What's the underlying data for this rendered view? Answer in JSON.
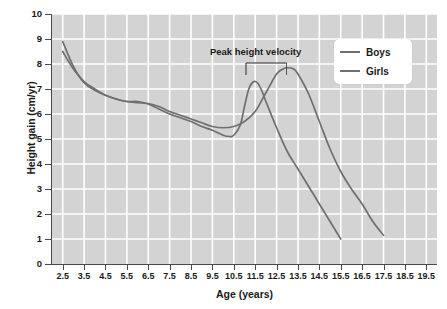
{
  "chart_data": {
    "type": "line",
    "title": "",
    "xlabel": "Age (years)",
    "ylabel": "Height gain (cm/yr)",
    "xlim": [
      2.0,
      20.0
    ],
    "ylim": [
      0,
      10
    ],
    "grid": true,
    "legend_position": "top-right",
    "x_ticks": [
      "2.5",
      "3.5",
      "4.5",
      "5.5",
      "6.5",
      "7.5",
      "8.5",
      "9.5",
      "10.5",
      "11.5",
      "12.5",
      "13.5",
      "14.5",
      "15.5",
      "16.5",
      "17.5",
      "18.5",
      "19.5"
    ],
    "y_ticks": [
      "0",
      "1",
      "2",
      "3",
      "4",
      "5",
      "6",
      "7",
      "8",
      "9",
      "10"
    ],
    "annotations": [
      {
        "text": "Peak height velocity",
        "bracket_from_x": 11.0,
        "bracket_to_x": 13.0,
        "bracket_y": 8.1
      }
    ],
    "series": [
      {
        "name": "Boys",
        "color": "#6f6f6f",
        "x": [
          2.5,
          3.0,
          3.5,
          4.0,
          4.5,
          5.0,
          5.5,
          6.0,
          6.5,
          7.0,
          7.5,
          8.0,
          8.5,
          9.0,
          9.5,
          10.0,
          10.5,
          11.0,
          11.5,
          12.0,
          12.5,
          12.8,
          13.0,
          13.3,
          13.5,
          14.0,
          14.5,
          15.0,
          15.5,
          16.0,
          16.5,
          17.0,
          17.5
        ],
        "y": [
          8.9,
          7.9,
          7.25,
          6.95,
          6.75,
          6.6,
          6.5,
          6.45,
          6.42,
          6.3,
          6.1,
          5.95,
          5.8,
          5.65,
          5.5,
          5.45,
          5.5,
          5.7,
          6.1,
          6.85,
          7.6,
          7.8,
          7.85,
          7.8,
          7.6,
          6.8,
          5.7,
          4.6,
          3.7,
          3.0,
          2.4,
          1.7,
          1.15
        ]
      },
      {
        "name": "Girls",
        "color": "#6f6f6f",
        "x": [
          2.5,
          3.0,
          3.5,
          4.0,
          4.5,
          5.0,
          5.5,
          6.0,
          6.5,
          7.0,
          7.5,
          8.0,
          8.5,
          9.0,
          9.5,
          10.0,
          10.3,
          10.5,
          10.8,
          11.0,
          11.2,
          11.4,
          11.6,
          11.8,
          12.0,
          12.5,
          13.0,
          13.5,
          14.0,
          14.5,
          15.0,
          15.5
        ],
        "y": [
          8.5,
          7.8,
          7.3,
          7.0,
          6.75,
          6.6,
          6.5,
          6.5,
          6.4,
          6.2,
          6.0,
          5.85,
          5.7,
          5.5,
          5.35,
          5.15,
          5.1,
          5.15,
          5.55,
          6.3,
          7.0,
          7.28,
          7.25,
          6.95,
          6.5,
          5.45,
          4.5,
          3.8,
          3.1,
          2.4,
          1.7,
          1.0
        ]
      }
    ]
  },
  "legend": {
    "items": [
      {
        "label": "Boys"
      },
      {
        "label": "Girls"
      }
    ]
  }
}
